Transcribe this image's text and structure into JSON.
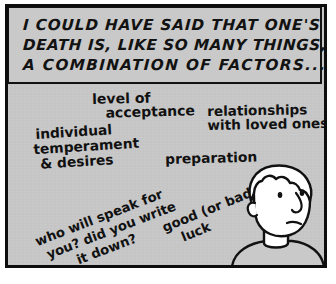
{
  "comic": {
    "panel": {
      "background_color": "#c9c9c9",
      "border_color": "#0d0d0d",
      "page_color": "#ffffff"
    },
    "caption": {
      "lines": [
        "I COULD HAVE SAID THAT ONE'S",
        "DEATH IS, LIKE SO MANY THINGS,",
        "A COMBINATION OF FACTORS..."
      ]
    },
    "handwritten_notes": [
      {
        "id": "acceptance",
        "lines": [
          "level of",
          "acceptance"
        ]
      },
      {
        "id": "relationships",
        "lines": [
          "relationships",
          "with loved ones"
        ]
      },
      {
        "id": "temperament",
        "lines": [
          "individual",
          "temperament",
          "& desires"
        ]
      },
      {
        "id": "preparation",
        "lines": [
          "preparation"
        ]
      },
      {
        "id": "speak",
        "lines": [
          "who will speak for",
          "you? did you write",
          "it down?"
        ]
      },
      {
        "id": "luck",
        "lines": [
          "good (or bad)",
          "luck"
        ]
      }
    ],
    "character": {
      "description": "boy-figure",
      "hair_color": "#ffffff",
      "skin_color": "#ffffff",
      "shirt_color": "#c9c9c9",
      "ink_color": "#111111"
    }
  }
}
